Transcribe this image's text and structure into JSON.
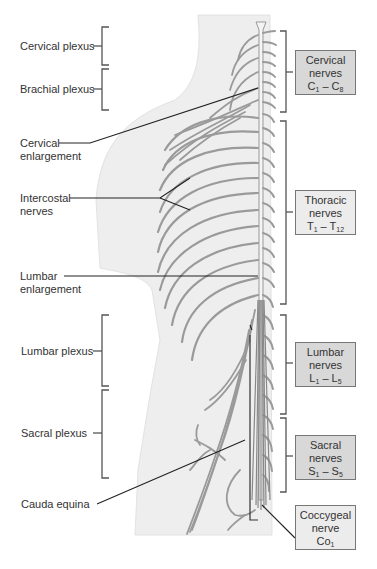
{
  "figure": {
    "colors": {
      "body_silhouette": "#eeeeee",
      "nerve": "#9a9a9a",
      "leader_line": "#222222",
      "bracket": "#555555",
      "box_dark": "#d8d8d8",
      "box_light": "#ececec",
      "box_border": "#777777",
      "text": "#333333"
    }
  },
  "left_labels": [
    {
      "id": "cervical-plexus",
      "line1": "Cervical plexus",
      "line2": ""
    },
    {
      "id": "brachial-plexus",
      "line1": "Brachial plexus",
      "line2": ""
    },
    {
      "id": "cervical-enlargement",
      "line1": "Cervical",
      "line2": "enlargement"
    },
    {
      "id": "intercostal-nerves",
      "line1": "Intercostal",
      "line2": "nerves"
    },
    {
      "id": "lumbar-enlargement",
      "line1": "Lumbar",
      "line2": "enlargement"
    },
    {
      "id": "lumbar-plexus",
      "line1": "Lumbar plexus",
      "line2": ""
    },
    {
      "id": "sacral-plexus",
      "line1": "Sacral plexus",
      "line2": ""
    },
    {
      "id": "cauda-equina",
      "line1": "Cauda equina",
      "line2": ""
    }
  ],
  "right_boxes": [
    {
      "id": "cervical-nerves",
      "line1": "Cervical",
      "line2": "nerves",
      "range_a": "C",
      "sub_a": "1",
      "dash": " – ",
      "range_b": "C",
      "sub_b": "8",
      "shade": "dark"
    },
    {
      "id": "thoracic-nerves",
      "line1": "Thoracic",
      "line2": "nerves",
      "range_a": "T",
      "sub_a": "1",
      "dash": " – ",
      "range_b": "T",
      "sub_b": "12",
      "shade": "light"
    },
    {
      "id": "lumbar-nerves",
      "line1": "Lumbar",
      "line2": "nerves",
      "range_a": "L",
      "sub_a": "1",
      "dash": " – ",
      "range_b": "L",
      "sub_b": "5",
      "shade": "dark"
    },
    {
      "id": "sacral-nerves",
      "line1": "Sacral",
      "line2": "nerves",
      "range_a": "S",
      "sub_a": "1",
      "dash": " – ",
      "range_b": "S",
      "sub_b": "5",
      "shade": "dark"
    },
    {
      "id": "coccygeal-nerve",
      "line1": "Coccygeal",
      "line2": "nerve",
      "range_a": "Co",
      "sub_a": "1",
      "dash": "",
      "range_b": "",
      "sub_b": "",
      "shade": "light"
    }
  ]
}
